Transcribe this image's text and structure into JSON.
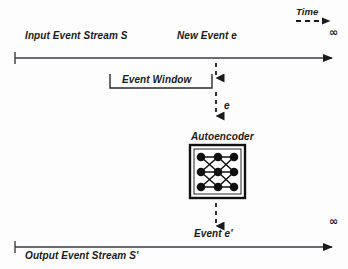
{
  "figure": {
    "stroke_color": "#1a1a1a",
    "background": "#fdfdfd"
  },
  "time_axis": {
    "label": "Time",
    "arrow_style": "dashed",
    "icon": "dashed-arrow-right-icon"
  },
  "input_stream": {
    "label": "Input Event Stream S",
    "new_event_label": "New Event e",
    "infinity_symbol": "∞",
    "axis_icon": "arrow-right-icon"
  },
  "event_window": {
    "label": "Event Window",
    "bracket_icon": "window-bracket-icon"
  },
  "flow": {
    "event_into_model_label": "e",
    "event_out_label": "Event e'",
    "arrow_down_icon": "dashed-arrow-down-icon"
  },
  "autoencoder": {
    "label": "Autoencoder",
    "node_icon": "neuron-node-icon",
    "layers": 3,
    "nodes_per_layer": 3,
    "box_icon": "model-box-icon"
  },
  "output_stream": {
    "label": "Output Event Stream S'",
    "infinity_symbol": "∞",
    "axis_icon": "arrow-right-icon"
  }
}
